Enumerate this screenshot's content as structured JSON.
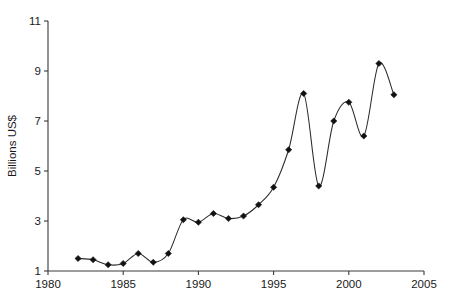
{
  "chart_data": {
    "type": "line",
    "title": "",
    "subtitle": "",
    "xlabel": "",
    "ylabel": "Billions US$",
    "xlim": [
      1980,
      2005
    ],
    "ylim": [
      1,
      11
    ],
    "grid": false,
    "legend": null,
    "x_ticks": [
      1980,
      1985,
      1990,
      1995,
      2000,
      2005
    ],
    "x_tick_labels": [
      "1980",
      "1985",
      "1990",
      "1995",
      "2000",
      "2005"
    ],
    "y_ticks": [
      1,
      3,
      5,
      7,
      9,
      11
    ],
    "y_tick_labels": [
      "1",
      "3",
      "5",
      "7",
      "9",
      "11"
    ],
    "marker": "diamond",
    "line_color": "#2b2b2b",
    "marker_color": "#111111",
    "series": [
      {
        "name": "Billions US$",
        "x": [
          1982,
          1983,
          1984,
          1985,
          1986,
          1987,
          1988,
          1989,
          1990,
          1991,
          1992,
          1993,
          1994,
          1995,
          1996,
          1997,
          1998,
          1999,
          2000,
          2001,
          2002,
          2003
        ],
        "values": [
          1.5,
          1.45,
          1.25,
          1.3,
          1.7,
          1.35,
          1.7,
          3.05,
          2.95,
          3.3,
          3.1,
          3.2,
          3.65,
          4.35,
          5.85,
          8.1,
          4.4,
          7.0,
          7.75,
          6.4,
          9.3,
          8.05
        ]
      }
    ]
  },
  "figure": {
    "background_color": "#ffffff",
    "axis_color": "#3a3a3a"
  }
}
